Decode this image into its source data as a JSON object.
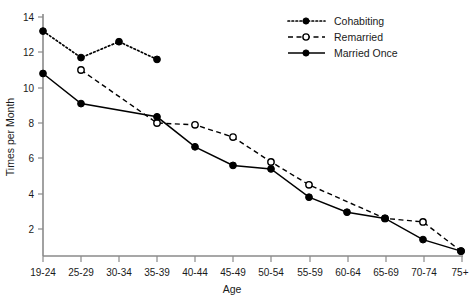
{
  "chart_data": {
    "type": "line",
    "title": "",
    "xlabel": "Age",
    "ylabel": "Times per Month",
    "categories": [
      "19-24",
      "25-29",
      "30-34",
      "35-39",
      "40-44",
      "45-49",
      "50-54",
      "55-59",
      "60-64",
      "65-69",
      "70-74",
      "75+"
    ],
    "xlim": [
      0,
      11
    ],
    "ylim": [
      0,
      14.6
    ],
    "yticks": [
      2,
      4,
      6,
      8,
      10,
      12,
      14
    ],
    "ytick_labels": [
      "2",
      "4",
      "6",
      "8",
      "10",
      "12",
      "14"
    ],
    "grid": false,
    "legend_position": "top-right",
    "series": [
      {
        "name": "Cohabiting",
        "marker": "filled-circle",
        "linestyle": "dotted",
        "color": "#000000",
        "values": [
          13.2,
          11.7,
          12.6,
          11.6,
          null,
          null,
          null,
          null,
          null,
          null,
          null,
          null
        ]
      },
      {
        "name": "Remarried",
        "marker": "open-circle",
        "linestyle": "dashed",
        "color": "#000000",
        "values": [
          null,
          11.0,
          null,
          8.0,
          7.9,
          7.2,
          5.8,
          4.5,
          null,
          2.6,
          2.4,
          0.75
        ]
      },
      {
        "name": "Married Once",
        "marker": "filled-circle",
        "linestyle": "solid",
        "color": "#000000",
        "values": [
          10.8,
          9.1,
          null,
          8.35,
          6.65,
          5.6,
          5.4,
          3.8,
          2.95,
          2.6,
          1.4,
          0.75
        ]
      }
    ]
  },
  "axes": {
    "y_title": "Times per Month",
    "x_title": "Age",
    "y_tick_labels": [
      "14",
      "12",
      "10",
      "8",
      "6",
      "4",
      "2"
    ],
    "x_tick_labels": [
      "19-24",
      "25-29",
      "30-34",
      "35-39",
      "40-44",
      "45-49",
      "50-54",
      "55-59",
      "60-64",
      "65-69",
      "70-74",
      "75+"
    ]
  },
  "legend": {
    "entries": [
      {
        "label": "Cohabiting"
      },
      {
        "label": "Remarried"
      },
      {
        "label": "Married Once"
      }
    ]
  }
}
